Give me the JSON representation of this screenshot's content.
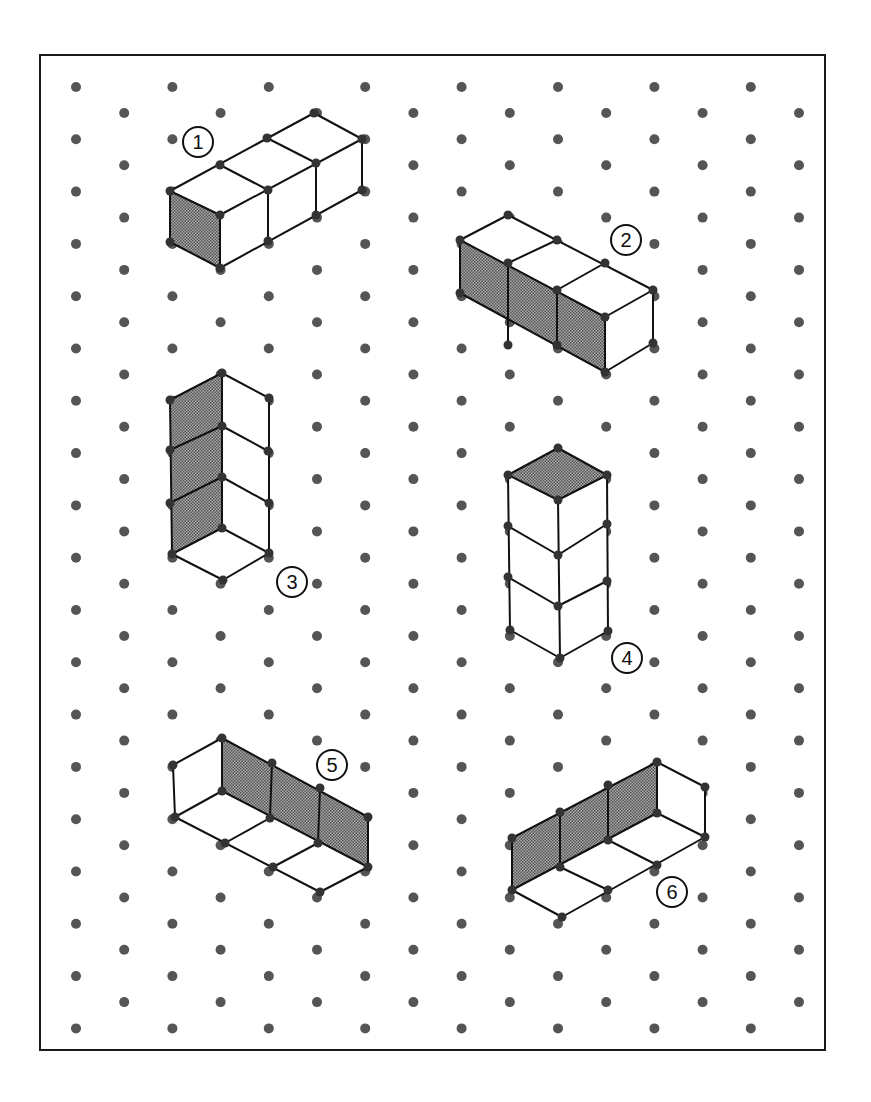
{
  "figure": {
    "frame": {
      "x": 40,
      "y": 55,
      "width": 785,
      "height": 995,
      "stroke": "#1a1a1a",
      "stroke_width": 2
    },
    "dot_grid": {
      "type": "isometric",
      "x0": 76,
      "dx": 48.2,
      "columns": 16,
      "y0_even": 87,
      "y0_odd": 113,
      "dy": 52.3,
      "rows": 19,
      "radius": 5,
      "color": "#555555"
    },
    "style": {
      "line_color": "#111111",
      "line_width": 2,
      "shade_color": "#8c8c8c",
      "vertex_radius": 4.5,
      "vertex_color": "#333333"
    },
    "shapes": [
      {
        "id": 1,
        "label": "1",
        "label_pos": [
          198,
          142
        ],
        "description": "Three cubes in a row extending back-right, left end face shaded",
        "shaded": [
          [
            [
              170,
              191
            ],
            [
              220,
              215
            ],
            [
              220,
              268
            ],
            [
              170,
              242
            ]
          ]
        ],
        "white": [
          [
            [
              170,
              191
            ],
            [
              314,
              113
            ],
            [
              362,
              139
            ],
            [
              220,
              215
            ]
          ],
          [
            [
              220,
              215
            ],
            [
              362,
              139
            ],
            [
              362,
              190
            ],
            [
              220,
              268
            ]
          ]
        ],
        "lines": [
          [
            [
              170,
              191
            ],
            [
              314,
              113
            ]
          ],
          [
            [
              314,
              113
            ],
            [
              362,
              139
            ]
          ],
          [
            [
              362,
              139
            ],
            [
              220,
              215
            ]
          ],
          [
            [
              220,
              215
            ],
            [
              170,
              191
            ]
          ],
          [
            [
              220,
              165
            ],
            [
              268,
              190
            ]
          ],
          [
            [
              267,
              138
            ],
            [
              316,
              163
            ]
          ],
          [
            [
              170,
              191
            ],
            [
              170,
              242
            ]
          ],
          [
            [
              170,
              242
            ],
            [
              220,
              268
            ]
          ],
          [
            [
              220,
              215
            ],
            [
              220,
              268
            ]
          ],
          [
            [
              220,
              268
            ],
            [
              362,
              190
            ]
          ],
          [
            [
              362,
              139
            ],
            [
              362,
              190
            ]
          ],
          [
            [
              268,
              190
            ],
            [
              268,
              241
            ]
          ],
          [
            [
              316,
              163
            ],
            [
              316,
              215
            ]
          ]
        ]
      },
      {
        "id": 2,
        "label": "2",
        "label_pos": [
          626,
          240
        ],
        "description": "Three cubes in a row extending front-right, long left side face shaded",
        "shaded": [
          [
            [
              460,
              240
            ],
            [
              605,
              317
            ],
            [
              605,
              372
            ],
            [
              460,
              293
            ]
          ]
        ],
        "white": [
          [
            [
              460,
              240
            ],
            [
              508,
              215
            ],
            [
              653,
              290
            ],
            [
              605,
              317
            ]
          ],
          [
            [
              605,
              317
            ],
            [
              653,
              290
            ],
            [
              653,
              343
            ],
            [
              605,
              372
            ]
          ]
        ],
        "lines": [
          [
            [
              460,
              240
            ],
            [
              508,
              215
            ]
          ],
          [
            [
              508,
              215
            ],
            [
              653,
              290
            ]
          ],
          [
            [
              653,
              290
            ],
            [
              605,
              317
            ]
          ],
          [
            [
              605,
              317
            ],
            [
              460,
              240
            ]
          ],
          [
            [
              508,
              263
            ],
            [
              557,
              240
            ]
          ],
          [
            [
              557,
              290
            ],
            [
              605,
              263
            ]
          ],
          [
            [
              460,
              240
            ],
            [
              460,
              293
            ]
          ],
          [
            [
              460,
              293
            ],
            [
              605,
              372
            ]
          ],
          [
            [
              605,
              317
            ],
            [
              605,
              372
            ]
          ],
          [
            [
              653,
              290
            ],
            [
              653,
              343
            ]
          ],
          [
            [
              653,
              343
            ],
            [
              605,
              372
            ]
          ],
          [
            [
              508,
              263
            ],
            [
              508,
              345
            ]
          ],
          [
            [
              557,
              290
            ],
            [
              557,
              345
            ]
          ]
        ]
      },
      {
        "id": 3,
        "label": "3",
        "label_pos": [
          292,
          582
        ],
        "description": "Three-cube vertical column viewed from below/inside, left inner walls shaded, floor visible",
        "shaded": [
          [
            [
              170,
              400
            ],
            [
              222,
              373
            ],
            [
              222,
              528
            ],
            [
              172,
              554
            ]
          ]
        ],
        "white": [
          [
            [
              222,
              373
            ],
            [
              269,
              398
            ],
            [
              269,
              553
            ],
            [
              222,
              528
            ]
          ],
          [
            [
              172,
              554
            ],
            [
              222,
              528
            ],
            [
              269,
              553
            ],
            [
              223,
              580
            ]
          ]
        ],
        "lines": [
          [
            [
              170,
              400
            ],
            [
              222,
              373
            ]
          ],
          [
            [
              222,
              373
            ],
            [
              269,
              398
            ]
          ],
          [
            [
              170,
              400
            ],
            [
              172,
              554
            ]
          ],
          [
            [
              222,
              373
            ],
            [
              222,
              528
            ]
          ],
          [
            [
              269,
              398
            ],
            [
              269,
              553
            ]
          ],
          [
            [
              170,
              450
            ],
            [
              222,
              426
            ]
          ],
          [
            [
              170,
              503
            ],
            [
              222,
              477
            ]
          ],
          [
            [
              222,
              426
            ],
            [
              268,
              451
            ]
          ],
          [
            [
              222,
              477
            ],
            [
              269,
              503
            ]
          ],
          [
            [
              172,
              554
            ],
            [
              222,
              528
            ]
          ],
          [
            [
              222,
              528
            ],
            [
              269,
              553
            ]
          ],
          [
            [
              269,
              553
            ],
            [
              223,
              580
            ]
          ],
          [
            [
              223,
              580
            ],
            [
              172,
              554
            ]
          ]
        ]
      },
      {
        "id": 4,
        "label": "4",
        "label_pos": [
          627,
          658
        ],
        "description": "Three-cube vertical tower, top face shaded",
        "shaded": [
          [
            [
              558,
              448
            ],
            [
              607,
              475
            ],
            [
              558,
              500
            ],
            [
              508,
              475
            ]
          ]
        ],
        "white": [
          [
            [
              508,
              475
            ],
            [
              558,
              500
            ],
            [
              560,
              658
            ],
            [
              510,
              630
            ]
          ],
          [
            [
              558,
              500
            ],
            [
              607,
              475
            ],
            [
              608,
              631
            ],
            [
              560,
              658
            ]
          ]
        ],
        "lines": [
          [
            [
              558,
              448
            ],
            [
              607,
              475
            ]
          ],
          [
            [
              607,
              475
            ],
            [
              558,
              500
            ]
          ],
          [
            [
              558,
              500
            ],
            [
              508,
              475
            ]
          ],
          [
            [
              508,
              475
            ],
            [
              558,
              448
            ]
          ],
          [
            [
              508,
              475
            ],
            [
              510,
              630
            ]
          ],
          [
            [
              558,
              500
            ],
            [
              560,
              658
            ]
          ],
          [
            [
              607,
              475
            ],
            [
              608,
              631
            ]
          ],
          [
            [
              508,
              526
            ],
            [
              558,
              555
            ]
          ],
          [
            [
              558,
              555
            ],
            [
              607,
              524
            ]
          ],
          [
            [
              508,
              577
            ],
            [
              558,
              606
            ]
          ],
          [
            [
              558,
              606
            ],
            [
              607,
              581
            ]
          ],
          [
            [
              510,
              630
            ],
            [
              560,
              658
            ]
          ],
          [
            [
              560,
              658
            ],
            [
              608,
              631
            ]
          ]
        ]
      },
      {
        "id": 5,
        "label": "5",
        "label_pos": [
          332,
          765
        ],
        "description": "Open three-cube trough extending front-right, long back wall shaded",
        "shaded": [
          [
            [
              222,
              738
            ],
            [
              368,
              817
            ],
            [
              368,
              867
            ],
            [
              222,
              791
            ]
          ]
        ],
        "white": [
          [
            [
              173,
              765
            ],
            [
              222,
              738
            ],
            [
              222,
              791
            ],
            [
              175,
              817
            ]
          ],
          [
            [
              175,
              817
            ],
            [
              222,
              791
            ],
            [
              368,
              867
            ],
            [
              320,
              892
            ]
          ]
        ],
        "lines": [
          [
            [
              173,
              765
            ],
            [
              222,
              738
            ]
          ],
          [
            [
              222,
              738
            ],
            [
              368,
              817
            ]
          ],
          [
            [
              368,
              817
            ],
            [
              368,
              867
            ]
          ],
          [
            [
              173,
              765
            ],
            [
              175,
              817
            ]
          ],
          [
            [
              222,
              738
            ],
            [
              222,
              791
            ]
          ],
          [
            [
              272,
              763
            ],
            [
              270,
              818
            ]
          ],
          [
            [
              320,
              788
            ],
            [
              318,
              843
            ]
          ],
          [
            [
              222,
              791
            ],
            [
              368,
              867
            ]
          ],
          [
            [
              175,
              817
            ],
            [
              222,
              791
            ]
          ],
          [
            [
              175,
              817
            ],
            [
              320,
              892
            ]
          ],
          [
            [
              320,
              892
            ],
            [
              368,
              867
            ]
          ],
          [
            [
              225,
              843
            ],
            [
              270,
              818
            ]
          ],
          [
            [
              273,
              867
            ],
            [
              318,
              843
            ]
          ]
        ]
      },
      {
        "id": 6,
        "label": "6",
        "label_pos": [
          672,
          892
        ],
        "description": "Open three-cube trough extending back-right, long back wall shaded",
        "shaded": [
          [
            [
              512,
              838
            ],
            [
              657,
              762
            ],
            [
              657,
              813
            ],
            [
              512,
              890
            ]
          ]
        ],
        "white": [
          [
            [
              657,
              762
            ],
            [
              705,
              787
            ],
            [
              705,
              837
            ],
            [
              657,
              813
            ]
          ],
          [
            [
              512,
              890
            ],
            [
              657,
              813
            ],
            [
              705,
              837
            ],
            [
              562,
              917
            ]
          ]
        ],
        "lines": [
          [
            [
              512,
              838
            ],
            [
              657,
              762
            ]
          ],
          [
            [
              657,
              762
            ],
            [
              705,
              787
            ]
          ],
          [
            [
              705,
              787
            ],
            [
              705,
              837
            ]
          ],
          [
            [
              512,
              838
            ],
            [
              512,
              890
            ]
          ],
          [
            [
              657,
              762
            ],
            [
              657,
              813
            ]
          ],
          [
            [
              560,
              812
            ],
            [
              560,
              867
            ]
          ],
          [
            [
              608,
              785
            ],
            [
              608,
              840
            ]
          ],
          [
            [
              512,
              890
            ],
            [
              657,
              813
            ]
          ],
          [
            [
              657,
              813
            ],
            [
              705,
              837
            ]
          ],
          [
            [
              512,
              890
            ],
            [
              562,
              917
            ]
          ],
          [
            [
              562,
              917
            ],
            [
              705,
              837
            ]
          ],
          [
            [
              560,
              867
            ],
            [
              608,
              890
            ]
          ],
          [
            [
              608,
              840
            ],
            [
              657,
              865
            ]
          ]
        ]
      }
    ],
    "label_circle": {
      "radius": 15,
      "stroke": "#111111",
      "stroke_width": 2
    }
  }
}
